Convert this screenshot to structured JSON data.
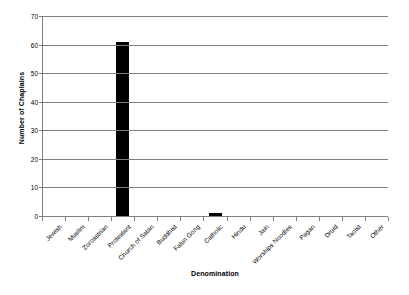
{
  "chart_data": {
    "type": "bar",
    "title": "",
    "xlabel": "Denomination",
    "ylabel": "Number of Chaplains",
    "categories": [
      "Jewish",
      "Muslim",
      "Zoroastrian",
      "Protestant",
      "Church of Satan",
      "Buddhist",
      "Falun Gong",
      "Catholic",
      "Hindu",
      "Jain",
      "Worships Noodles",
      "Pagan",
      "Druid",
      "Taoist",
      "Other"
    ],
    "values": [
      0,
      0,
      0,
      61,
      0,
      0,
      0,
      1,
      0,
      0,
      0,
      0,
      0,
      0,
      0
    ],
    "ylim": [
      0,
      70
    ],
    "ytick_values": [
      0,
      10,
      20,
      30,
      40,
      50,
      60,
      70
    ],
    "ytick_labels": [
      "0",
      "10",
      "20",
      "30",
      "40",
      "50",
      "60",
      "70"
    ],
    "grid": "horizontal",
    "legend": "none",
    "bar_color": "#000000",
    "gridline_color": "#808080",
    "background_color": "#FFFFFF"
  }
}
